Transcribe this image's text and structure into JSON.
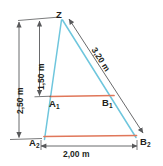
{
  "diagram": {
    "points": [
      {
        "id": "Z",
        "label": "Z",
        "sub": "",
        "x": 61,
        "y": 16
      },
      {
        "id": "A1",
        "label": "A",
        "sub": "1",
        "x": 48,
        "y": 104
      },
      {
        "id": "B1",
        "label": "B",
        "sub": "1",
        "x": 106,
        "y": 103
      },
      {
        "id": "A2",
        "label": "A",
        "sub": "2",
        "x": 33,
        "y": 142
      },
      {
        "id": "B2",
        "label": "B",
        "sub": "2",
        "x": 140,
        "y": 140
      }
    ],
    "dimensions": [
      {
        "id": "height-total",
        "value": "2,50 m",
        "orientation": "vertical",
        "x": 14,
        "y": 108
      },
      {
        "id": "height-inner",
        "value": "1,50 m",
        "orientation": "vertical",
        "x": 36,
        "y": 85
      },
      {
        "id": "hypotenuse",
        "value": "3,20 m",
        "orientation": "diagonal",
        "x": 100,
        "y": 42
      },
      {
        "id": "base-width",
        "value": "2,00 m",
        "orientation": "horizontal",
        "x": 62,
        "y": 152
      }
    ],
    "colors": {
      "ray": "#6ec6dd",
      "crossbar": "#e0775a",
      "dimension": "#58595b",
      "text": "#231f20",
      "background": "#ffffff"
    }
  }
}
